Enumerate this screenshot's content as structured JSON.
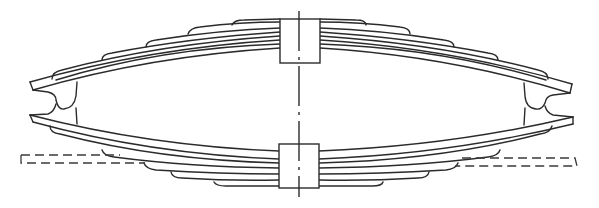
{
  "diagram": {
    "title": "Elliptic leaf spring pair (technical line drawing)",
    "line_color": "#2b2b2b",
    "background": "#ffffff",
    "components": {
      "upper_spring": {
        "label": "upper leaf spring",
        "leaves": 6,
        "curvature": "convex-up"
      },
      "lower_spring": {
        "label": "lower leaf spring",
        "leaves": 6,
        "curvature": "convex-down"
      },
      "upper_clamp": {
        "label": "upper center clamp"
      },
      "lower_clamp": {
        "label": "lower center clamp"
      },
      "left_shackle": {
        "label": "left end shackle"
      },
      "right_shackle": {
        "label": "right end shackle"
      },
      "center_axis": {
        "label": "center line (dash-dot)"
      },
      "left_reference": {
        "label": "left dashed reference outline"
      },
      "right_reference": {
        "label": "right dashed reference outline"
      }
    }
  }
}
